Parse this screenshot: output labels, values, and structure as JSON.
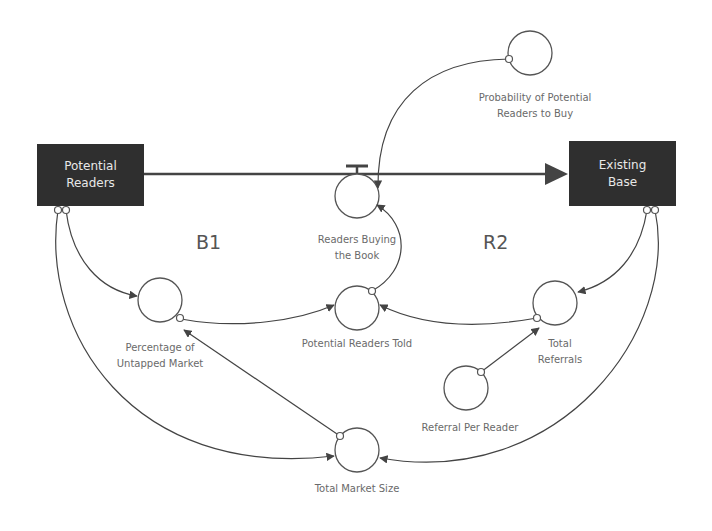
{
  "diagram": {
    "type": "stock-and-flow",
    "stocks": [
      {
        "id": "potential_readers",
        "label": "Potential\nReaders"
      },
      {
        "id": "existing_base",
        "label": "Existing\nBase"
      }
    ],
    "flow": {
      "id": "readers_buying",
      "label": "Readers Buying\nthe Book",
      "from": "Potential Readers",
      "to": "Existing Base"
    },
    "variables": [
      {
        "id": "probability",
        "label": "Probability of Potential\nReaders to Buy"
      },
      {
        "id": "potential_told",
        "label": "Potential Readers Told"
      },
      {
        "id": "percentage_untapped",
        "label": "Percentage of\nUntapped Market"
      },
      {
        "id": "total_referrals",
        "label": "Total\nReferrals"
      },
      {
        "id": "referral_per_reader",
        "label": "Referral Per Reader"
      },
      {
        "id": "total_market_size",
        "label": "Total Market Size"
      }
    ],
    "loops": [
      {
        "id": "B1",
        "label": "B1"
      },
      {
        "id": "R2",
        "label": "R2"
      }
    ],
    "links": [
      {
        "from": "Probability of Potential Readers to Buy",
        "to": "Readers Buying the Book"
      },
      {
        "from": "Potential Readers Told",
        "to": "Readers Buying the Book"
      },
      {
        "from": "Potential Readers",
        "to": "Percentage of Untapped Market"
      },
      {
        "from": "Potential Readers",
        "to": "Total Market Size"
      },
      {
        "from": "Percentage of Untapped Market",
        "to": "Potential Readers Told"
      },
      {
        "from": "Total Market Size",
        "to": "Percentage of Untapped Market"
      },
      {
        "from": "Existing Base",
        "to": "Total Referrals"
      },
      {
        "from": "Existing Base",
        "to": "Total Market Size"
      },
      {
        "from": "Total Referrals",
        "to": "Potential Readers Told"
      },
      {
        "from": "Referral Per Reader",
        "to": "Total Referrals"
      }
    ],
    "colors": {
      "stock_fill": "#2f2f2f",
      "stock_text": "#e8e8e8",
      "line": "#444444",
      "label": "#6a6a6a"
    }
  }
}
